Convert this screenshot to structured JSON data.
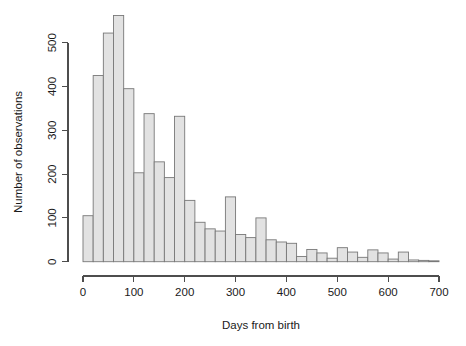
{
  "chart_data": {
    "type": "bar",
    "title": "",
    "subtitle": "",
    "xlabel": "Days from birth",
    "ylabel": "Number of observations",
    "xlim": [
      -8,
      712
    ],
    "ylim": [
      0,
      575
    ],
    "grid": false,
    "legend": null,
    "bin_width": 20,
    "x_ticks": [
      0,
      100,
      200,
      300,
      400,
      500,
      600,
      700
    ],
    "x_tick_labels": [
      "0",
      "100",
      "200",
      "300",
      "400",
      "500",
      "600",
      "700"
    ],
    "y_ticks": [
      0,
      100,
      200,
      300,
      400,
      500
    ],
    "y_tick_labels": [
      "0",
      "100",
      "200",
      "300",
      "400",
      "500"
    ],
    "bin_starts": [
      0,
      20,
      40,
      60,
      80,
      100,
      120,
      140,
      160,
      180,
      200,
      220,
      240,
      260,
      280,
      300,
      320,
      340,
      360,
      380,
      400,
      420,
      440,
      460,
      480,
      500,
      520,
      540,
      560,
      580,
      600,
      620,
      640,
      660,
      680
    ],
    "categories": [
      "0-20",
      "20-40",
      "40-60",
      "60-80",
      "80-100",
      "100-120",
      "120-140",
      "140-160",
      "160-180",
      "180-200",
      "200-220",
      "220-240",
      "240-260",
      "260-280",
      "280-300",
      "300-320",
      "320-340",
      "340-360",
      "360-380",
      "380-400",
      "400-420",
      "420-440",
      "440-460",
      "460-480",
      "480-500",
      "500-520",
      "520-540",
      "540-560",
      "560-580",
      "580-600",
      "600-620",
      "620-640",
      "640-660",
      "660-680",
      "680-700"
    ],
    "values": [
      105,
      425,
      522,
      562,
      395,
      203,
      338,
      228,
      192,
      332,
      140,
      90,
      75,
      70,
      148,
      62,
      55,
      100,
      50,
      45,
      42,
      12,
      28,
      20,
      8,
      32,
      22,
      10,
      27,
      20,
      6,
      22,
      4,
      3,
      2
    ]
  }
}
